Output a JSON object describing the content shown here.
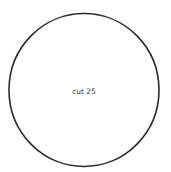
{
  "diagram": {
    "shape": "circle",
    "label": "cut 25",
    "stroke_color": "#2a2a2a",
    "fill_color": "#ffffff"
  }
}
